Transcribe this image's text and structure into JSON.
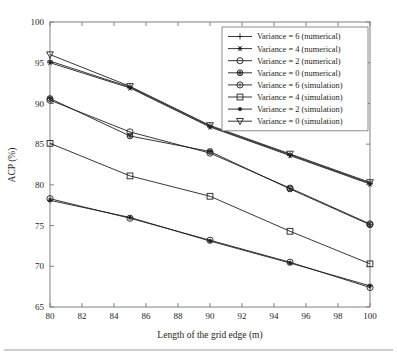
{
  "chart_data": {
    "type": "line",
    "title": "",
    "subtitle": "",
    "xlabel": "Length of the grid edge (m)",
    "ylabel": "ACP (%)",
    "x": [
      80,
      85,
      90,
      95,
      100
    ],
    "xlim": [
      80,
      100
    ],
    "ylim": [
      65,
      100
    ],
    "xticks": [
      80,
      82,
      84,
      86,
      88,
      90,
      92,
      94,
      96,
      98,
      100
    ],
    "yticks": [
      65,
      70,
      75,
      80,
      85,
      90,
      95,
      100
    ],
    "xtick_labels": [
      "80",
      "82",
      "84",
      "86",
      "88",
      "90",
      "92",
      "94",
      "96",
      "98",
      "100"
    ],
    "ytick_labels": [
      "65",
      "70",
      "75",
      "80",
      "85",
      "90",
      "95",
      "100"
    ],
    "grid": false,
    "legend_position": "upper right",
    "series": [
      {
        "name": "Variance = 6 (numerical)",
        "marker": "plus",
        "marker_fill": "open",
        "values": [
          95.2,
          92.0,
          87.2,
          83.7,
          80.2
        ]
      },
      {
        "name": "Variance = 4 (numerical)",
        "marker": "asterisk",
        "marker_fill": "solid",
        "values": [
          95.0,
          91.9,
          87.1,
          83.6,
          80.1
        ]
      },
      {
        "name": "Variance = 2 (numerical)",
        "marker": "circle",
        "marker_fill": "open",
        "values": [
          90.4,
          86.5,
          83.9,
          79.6,
          75.2
        ]
      },
      {
        "name": "Variance = 0 (numerical)",
        "marker": "star-circle",
        "marker_fill": "solid",
        "values": [
          90.6,
          86.0,
          84.1,
          79.5,
          75.1
        ]
      },
      {
        "name": "Variance = 6 (simulation)",
        "marker": "circle-dot",
        "marker_fill": "open",
        "values": [
          78.3,
          75.9,
          73.2,
          70.5,
          67.4
        ]
      },
      {
        "name": "Variance = 4 (simulation)",
        "marker": "square",
        "marker_fill": "open",
        "values": [
          85.1,
          81.1,
          78.6,
          74.3,
          70.3
        ]
      },
      {
        "name": "Variance = 2 (simulation)",
        "marker": "asterisk-small",
        "marker_fill": "solid",
        "values": [
          78.1,
          76.0,
          73.1,
          70.4,
          67.6
        ]
      },
      {
        "name": "Variance = 0 (simulation)",
        "marker": "triangle-down",
        "marker_fill": "open",
        "values": [
          96.0,
          92.1,
          87.3,
          83.8,
          80.3
        ]
      }
    ]
  },
  "colors": {
    "line": "#231f20",
    "axis": "#808080",
    "background": "#ffffff",
    "footer_rule": "#9a9a9a"
  }
}
